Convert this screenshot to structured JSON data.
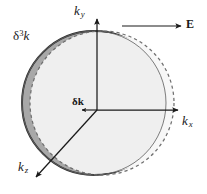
{
  "figure": {
    "type": "physics-diagram",
    "width": 207,
    "height": 194,
    "background_color": "#ffffff"
  },
  "axes": {
    "ky": {
      "symbol": "k",
      "subscript": "y",
      "direction": "up",
      "arrow": true,
      "origin": [
        97,
        110
      ],
      "tip": [
        97,
        17
      ]
    },
    "kx": {
      "symbol": "k",
      "subscript": "x",
      "direction": "right",
      "arrow": true,
      "origin": [
        97,
        110
      ],
      "tip": [
        180,
        110
      ]
    },
    "kz": {
      "symbol": "k",
      "subscript": "z",
      "direction": "down-left",
      "arrow": true,
      "origin": [
        97,
        110
      ],
      "tip": [
        34,
        180
      ]
    }
  },
  "field": {
    "label": "E",
    "bold": true,
    "direction": "right",
    "arrow_start": [
      122,
      26
    ],
    "arrow_end": [
      182,
      26
    ]
  },
  "shapes": {
    "equilibrium_sphere": {
      "name": "solid-circle",
      "style": "solid",
      "center": [
        94,
        103
      ],
      "radius": 72,
      "fill_color": "#eeeeee",
      "stroke_color": "#555555"
    },
    "displaced_sphere": {
      "name": "dashed-circle",
      "style": "dashed",
      "center": [
        102,
        103
      ],
      "radius": 72,
      "fill_color": "none",
      "stroke_color": "#777777"
    },
    "swept_crescent": {
      "name": "dark-crescent",
      "fill_color": "#a8a8a8",
      "stroke_color": "#333333",
      "side": "left"
    }
  },
  "labels": {
    "ky": {
      "base": "k",
      "sub": "y"
    },
    "kx": {
      "base": "k",
      "sub": "x"
    },
    "kz": {
      "base": "k",
      "sub": "z"
    },
    "field": "E",
    "volume_element": {
      "base": "δ",
      "sup": "3",
      "tail": "k"
    },
    "shift_vector": "δk"
  },
  "colors": {
    "sphere_fill": "#eeeeee",
    "crescent_fill": "#a8a8a8",
    "solid_stroke": "#555555",
    "dashed_stroke": "#777777",
    "axis_stroke": "#1a1a1a",
    "text": "#1a1a1a"
  }
}
